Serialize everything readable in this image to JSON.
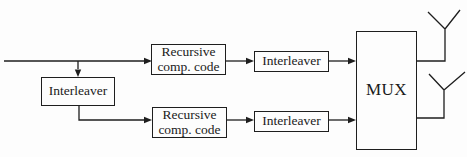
{
  "diagram": {
    "type": "block-diagram",
    "colors": {
      "line": "#1e1e1e",
      "background": "#fdfdfd"
    },
    "blocks": {
      "input_interleaver": {
        "label": "Interleaver"
      },
      "rcc_top": {
        "label": "Recursive comp. code"
      },
      "rcc_bottom": {
        "label": "Recursive comp. code"
      },
      "interleaver_top": {
        "label": "Interleaver"
      },
      "interleaver_bottom": {
        "label": "Interleaver"
      },
      "mux": {
        "label": "MUX"
      }
    },
    "icons": {
      "output_top": "antenna-icon",
      "output_bottom": "antenna-icon"
    }
  }
}
